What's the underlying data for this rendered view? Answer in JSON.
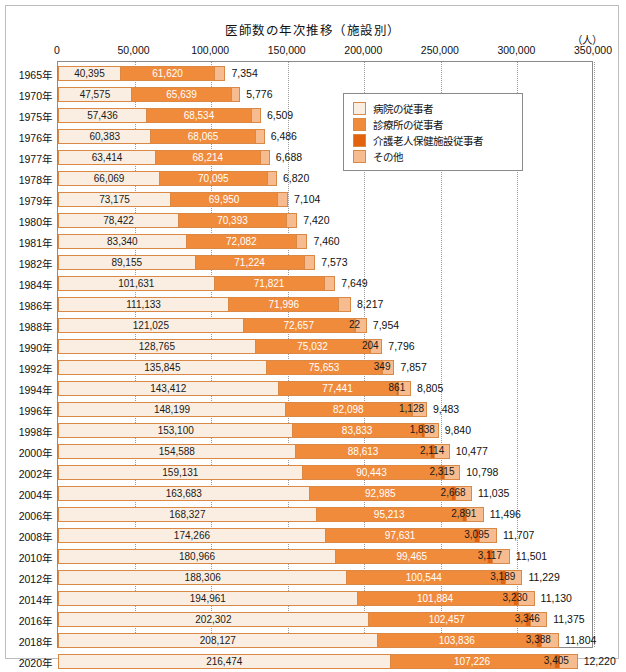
{
  "title": "医師数の年次推移（施設別）",
  "unit": "（人）",
  "axis": {
    "ticks": [
      "0",
      "50,000",
      "100,000",
      "150,000",
      "200,000",
      "250,000",
      "300,000",
      "350,000"
    ],
    "min": 0,
    "max": 350000,
    "step": 50000
  },
  "legend": {
    "items": [
      {
        "label": "病院の従事者",
        "color": "#faeee2"
      },
      {
        "label": "診療所の従事者",
        "color": "#f08b3c"
      },
      {
        "label": "介護老人保健施設従事者",
        "color": "#e2620f"
      },
      {
        "label": "その他",
        "color": "#f6bb8e"
      }
    ]
  },
  "chart_data": {
    "type": "bar",
    "orientation": "horizontal",
    "stacked": true,
    "title": "医師数の年次推移（施設別）",
    "xlabel": "（人）",
    "ylabel": "",
    "xlim": [
      0,
      350000
    ],
    "grid": true,
    "legend_position": "top-right-inside",
    "categories": [
      "1965年",
      "1970年",
      "1975年",
      "1976年",
      "1977年",
      "1978年",
      "1979年",
      "1980年",
      "1981年",
      "1982年",
      "1984年",
      "1986年",
      "1988年",
      "1990年",
      "1992年",
      "1994年",
      "1996年",
      "1998年",
      "2000年",
      "2002年",
      "2004年",
      "2006年",
      "2008年",
      "2010年",
      "2012年",
      "2014年",
      "2016年",
      "2018年",
      "2020年"
    ],
    "series": [
      {
        "name": "病院の従事者",
        "color": "#faeee2",
        "values": [
          40395,
          47575,
          57436,
          60383,
          63414,
          66069,
          73175,
          78422,
          83340,
          89155,
          101631,
          111133,
          121025,
          128765,
          135845,
          143412,
          148199,
          153100,
          154588,
          159131,
          163683,
          168327,
          174266,
          180966,
          188306,
          194961,
          202302,
          208127,
          216474
        ]
      },
      {
        "name": "診療所の従事者",
        "color": "#f08b3c",
        "values": [
          61620,
          65639,
          68534,
          68065,
          68214,
          70095,
          69950,
          70393,
          72082,
          71224,
          71821,
          71996,
          72657,
          75032,
          75653,
          77441,
          82098,
          83833,
          88613,
          90443,
          92985,
          95213,
          97631,
          99465,
          100544,
          101884,
          102457,
          103836,
          107226
        ]
      },
      {
        "name": "介護老人保健施設従事者",
        "color": "#e2620f",
        "values": [
          0,
          0,
          0,
          0,
          0,
          0,
          0,
          0,
          0,
          0,
          0,
          0,
          22,
          204,
          349,
          861,
          1128,
          1838,
          2114,
          2315,
          2668,
          2891,
          3095,
          3117,
          3189,
          3230,
          3346,
          3388,
          3405
        ]
      },
      {
        "name": "その他",
        "color": "#f6bb8e",
        "values": [
          7354,
          5776,
          6509,
          6486,
          6688,
          6820,
          7104,
          7420,
          7460,
          7573,
          7649,
          8217,
          7954,
          7796,
          7857,
          8805,
          9483,
          9840,
          10477,
          10798,
          11035,
          11496,
          11707,
          11501,
          11229,
          11130,
          11375,
          11804,
          12220
        ]
      }
    ],
    "labels": {
      "病院の従事者": [
        "40,395",
        "47,575",
        "57,436",
        "60,383",
        "63,414",
        "66,069",
        "73,175",
        "78,422",
        "83,340",
        "89,155",
        "101,631",
        "111,133",
        "121,025",
        "128,765",
        "135,845",
        "143,412",
        "148,199",
        "153,100",
        "154,588",
        "159,131",
        "163,683",
        "168,327",
        "174,266",
        "180,966",
        "188,306",
        "194,961",
        "202,302",
        "208,127",
        "216,474"
      ],
      "診療所の従事者": [
        "61,620",
        "65,639",
        "68,534",
        "68,065",
        "68,214",
        "70,095",
        "69,950",
        "70,393",
        "72,082",
        "71,224",
        "71,821",
        "71,996",
        "72,657",
        "75,032",
        "75,653",
        "77,441",
        "82,098",
        "83,833",
        "88,613",
        "90,443",
        "92,985",
        "95,213",
        "97,631",
        "99,465",
        "100,544",
        "101,884",
        "102,457",
        "103,836",
        "107,226"
      ],
      "介護老人保健施設従事者": [
        "",
        "",
        "",
        "",
        "",
        "",
        "",
        "",
        "",
        "",
        "",
        "",
        "22",
        "204",
        "349",
        "861",
        "1,128",
        "1,838",
        "2,114",
        "2,315",
        "2,668",
        "2,891",
        "3,095",
        "3,117",
        "3,189",
        "3,230",
        "3,346",
        "3,388",
        "3,405"
      ],
      "その他": [
        "7,354",
        "5,776",
        "6,509",
        "6,486",
        "6,688",
        "6,820",
        "7,104",
        "7,420",
        "7,460",
        "7,573",
        "7,649",
        "8,217",
        "7,954",
        "7,796",
        "7,857",
        "8,805",
        "9,483",
        "9,840",
        "10,477",
        "10,798",
        "11,035",
        "11,496",
        "11,707",
        "11,501",
        "11,229",
        "11,130",
        "11,375",
        "11,804",
        "12,220"
      ]
    }
  }
}
